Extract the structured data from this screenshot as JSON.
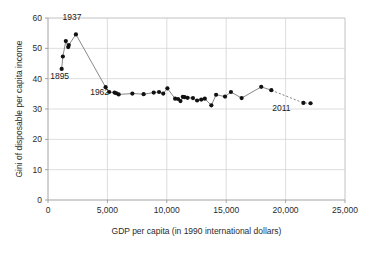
{
  "chart_data": {
    "type": "scatter",
    "title": "",
    "xlabel": "GDP per capita (in 1990 international dollars)",
    "ylabel": "Gini of disposable per capita income",
    "xlim": [
      0,
      25000
    ],
    "ylim": [
      0,
      60
    ],
    "grid": true,
    "legend": "none",
    "xticks": [
      0,
      5000,
      10000,
      15000,
      20000,
      25000
    ],
    "xticklabels": [
      "0",
      "5,000",
      "10,000",
      "15,000",
      "20,000",
      "25,000"
    ],
    "yticks": [
      0,
      10,
      20,
      30,
      40,
      50,
      60
    ],
    "yticklabels": [
      "0",
      "10",
      "20",
      "30",
      "40",
      "50",
      "60"
    ],
    "marker_color": "#111111",
    "line_color": "#7a7a7a",
    "grid_color": "#d4d4d4",
    "points": [
      {
        "x": 1150,
        "y": 43.2
      },
      {
        "x": 1250,
        "y": 47.3
      },
      {
        "x": 1500,
        "y": 52.4
      },
      {
        "x": 1700,
        "y": 50.4
      },
      {
        "x": 1750,
        "y": 51.1
      },
      {
        "x": 2350,
        "y": 54.6
      },
      {
        "x": 4850,
        "y": 37.2
      },
      {
        "x": 5150,
        "y": 35.6
      },
      {
        "x": 5600,
        "y": 35.4
      },
      {
        "x": 5750,
        "y": 35.2
      },
      {
        "x": 5950,
        "y": 34.8
      },
      {
        "x": 7100,
        "y": 35.1
      },
      {
        "x": 8050,
        "y": 34.9
      },
      {
        "x": 8900,
        "y": 35.4
      },
      {
        "x": 9350,
        "y": 35.6
      },
      {
        "x": 9700,
        "y": 35.1
      },
      {
        "x": 10050,
        "y": 36.8
      },
      {
        "x": 10700,
        "y": 33.4
      },
      {
        "x": 10950,
        "y": 33.3
      },
      {
        "x": 11150,
        "y": 32.6
      },
      {
        "x": 11350,
        "y": 34.0
      },
      {
        "x": 11500,
        "y": 33.9
      },
      {
        "x": 11750,
        "y": 33.7
      },
      {
        "x": 12200,
        "y": 33.6
      },
      {
        "x": 12550,
        "y": 32.8
      },
      {
        "x": 12900,
        "y": 33.1
      },
      {
        "x": 13200,
        "y": 33.4
      },
      {
        "x": 13750,
        "y": 31.2
      },
      {
        "x": 14150,
        "y": 34.7
      },
      {
        "x": 14900,
        "y": 34.1
      },
      {
        "x": 15400,
        "y": 35.6
      },
      {
        "x": 16300,
        "y": 33.6
      },
      {
        "x": 17950,
        "y": 37.3
      },
      {
        "x": 18800,
        "y": 36.2
      },
      {
        "x": 21500,
        "y": 32.0
      },
      {
        "x": 22100,
        "y": 31.9
      }
    ],
    "dashed_from_index": 33,
    "annotations": [
      {
        "label": "1895",
        "x": 1150,
        "y": 43.2,
        "dx": -2,
        "dy": -10
      },
      {
        "label": "1937",
        "x": 2350,
        "y": 54.6,
        "dx": -4,
        "dy": 14
      },
      {
        "label": "1962",
        "x": 4850,
        "y": 37.2,
        "dx": -6,
        "dy": -8
      },
      {
        "label": "2011",
        "x": 21500,
        "y": 32.0,
        "dx": -22,
        "dy": -8
      }
    ]
  }
}
